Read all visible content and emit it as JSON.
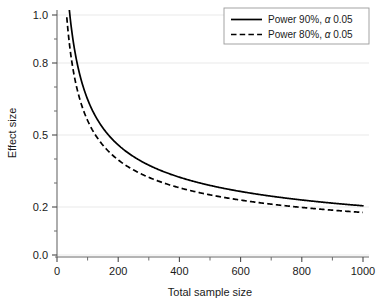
{
  "chart_data": {
    "type": "line",
    "title": "",
    "xlabel": "Total sample size",
    "ylabel": "Effect size",
    "xlim": [
      0,
      1040
    ],
    "ylim": [
      0.0,
      1.05
    ],
    "grid": true,
    "grid_axis": "y",
    "legend_position": "top-right",
    "x_ticks_major": [
      0,
      200,
      400,
      600,
      800,
      1000
    ],
    "x_tick_labels": [
      "0",
      "200",
      "400",
      "600",
      "800",
      "1000"
    ],
    "x_ticks_minor": [
      100,
      300,
      500,
      700,
      900
    ],
    "y_ticks": [
      0.0,
      0.2,
      0.5,
      0.8,
      1.0
    ],
    "y_tick_labels": [
      "0.0",
      "0.2",
      "0.5",
      "0.8",
      "1.0"
    ],
    "y_ticks_minor": [
      0.1,
      0.3,
      0.4,
      0.6,
      0.7,
      0.9
    ],
    "series": [
      {
        "name": "Power 90%, α 0.05",
        "style": "solid",
        "color": "#000000",
        "formula_constant": 6.484,
        "x": [
          34,
          40,
          50,
          60,
          70,
          80,
          90,
          100,
          120,
          140,
          160,
          180,
          200,
          250,
          300,
          350,
          400,
          450,
          500,
          550,
          600,
          650,
          700,
          750,
          800,
          850,
          900,
          950,
          1000
        ],
        "y": [
          1.112,
          1.025,
          0.917,
          0.837,
          0.775,
          0.725,
          0.683,
          0.648,
          0.592,
          0.548,
          0.513,
          0.483,
          0.458,
          0.41,
          0.374,
          0.347,
          0.324,
          0.306,
          0.29,
          0.276,
          0.265,
          0.254,
          0.245,
          0.237,
          0.229,
          0.222,
          0.216,
          0.21,
          0.205
        ]
      },
      {
        "name": "Power 80%, α 0.05",
        "style": "dashed",
        "color": "#000000",
        "formula_constant": 5.604,
        "x": [
          32,
          40,
          50,
          60,
          70,
          80,
          90,
          100,
          120,
          140,
          160,
          180,
          200,
          250,
          300,
          350,
          400,
          450,
          500,
          550,
          600,
          650,
          700,
          750,
          800,
          850,
          900,
          950,
          1000
        ],
        "y": [
          0.991,
          0.886,
          0.792,
          0.723,
          0.67,
          0.627,
          0.591,
          0.56,
          0.511,
          0.474,
          0.443,
          0.418,
          0.396,
          0.354,
          0.323,
          0.3,
          0.28,
          0.264,
          0.251,
          0.239,
          0.229,
          0.22,
          0.212,
          0.205,
          0.198,
          0.192,
          0.187,
          0.182,
          0.177
        ]
      }
    ]
  },
  "legend": {
    "entries": [
      {
        "label_prefix": "Power 90%, ",
        "alpha": "α",
        "label_suffix": " 0.05",
        "style": "solid"
      },
      {
        "label_prefix": "Power 80%, ",
        "alpha": "α",
        "label_suffix": " 0.05",
        "style": "dashed"
      }
    ]
  },
  "colors": {
    "axis": "#4a4a4a",
    "grid": "#e8e8e8",
    "curve": "#000000",
    "text": "#1a1a1a",
    "background": "#ffffff",
    "legend_border": "#9a9a9a"
  }
}
